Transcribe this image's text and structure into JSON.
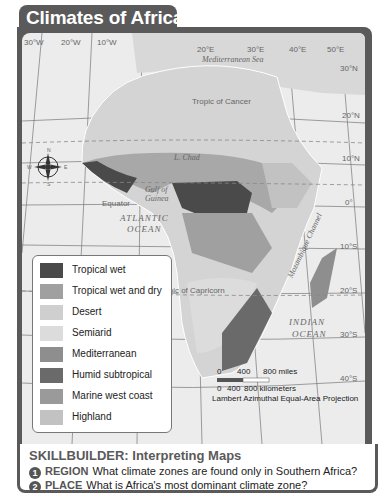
{
  "title": "Climates of Africa",
  "map": {
    "longitudes": [
      "30°W",
      "20°W",
      "10°W",
      "20°E",
      "30°E",
      "40°E",
      "50°E"
    ],
    "latitudes": [
      "30°N",
      "20°N",
      "10°N",
      "0°",
      "10°S",
      "20°S",
      "30°S",
      "40°S"
    ],
    "lines": {
      "tropic_cancer": "Tropic of Cancer",
      "equator": "Equator",
      "tropic_capricorn": "Tropic of Capricorn"
    },
    "water_labels": {
      "mediterranean": "Mediterranean Sea",
      "gulf": "Gulf of Guinea",
      "atlantic_1": "ATLANTIC",
      "atlantic_2": "OCEAN",
      "indian_1": "INDIAN",
      "indian_2": "OCEAN",
      "mozambique": "Mozambique Channel",
      "lake_chad": "L. Chad"
    },
    "compass": {
      "n": "N",
      "s": "S",
      "e": "E",
      "w": "W"
    },
    "scale": {
      "miles_0": "0",
      "miles_400": "400",
      "miles_800": "800 miles",
      "km_0": "0",
      "km_400": "400",
      "km_800": "800 kilometers"
    },
    "projection": "Lambert Azimuthal Equal-Area Projection"
  },
  "legend": [
    {
      "label": "Tropical wet",
      "color": "#4a4a4a"
    },
    {
      "label": "Tropical wet and dry",
      "color": "#a0a0a0"
    },
    {
      "label": "Desert",
      "color": "#cfcfcf"
    },
    {
      "label": "Semiarid",
      "color": "#dcdcdc"
    },
    {
      "label": "Mediterranean",
      "color": "#8e8e8e"
    },
    {
      "label": "Humid subtropical",
      "color": "#6a6a6a"
    },
    {
      "label": "Marine west coast",
      "color": "#9a9a9a"
    },
    {
      "label": "Highland",
      "color": "#c2c2c2"
    }
  ],
  "skillbuilder": {
    "title": "SKILLBUILDER: Interpreting Maps",
    "questions": [
      {
        "num": "1",
        "keyword": "REGION",
        "text": "What climate zones are found only in Southern Africa?"
      },
      {
        "num": "2",
        "keyword": "PLACE",
        "text": "What is Africa's most dominant climate zone?"
      }
    ]
  }
}
